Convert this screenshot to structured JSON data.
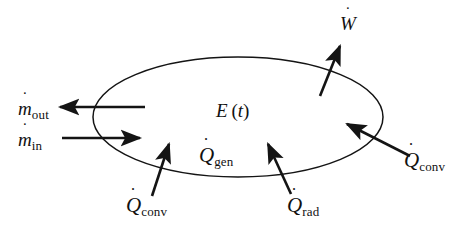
{
  "diagram": {
    "type": "control-volume-energy-balance",
    "stroke_color": "#141414",
    "background_color": "#ffffff",
    "boundary": {
      "shape": "ellipse",
      "name": "control-volume-boundary",
      "center_x": 238,
      "center_y": 117,
      "radius_x": 145,
      "radius_y": 60
    },
    "labels": {
      "energy_symbol": "E",
      "energy_arg_open": "(",
      "energy_arg_var": "t",
      "energy_arg_close": ")",
      "energy_full": "E (t)",
      "mdot_symbol": "m",
      "mdot_out_sub": "out",
      "mdot_in_sub": "in",
      "q_symbol": "Q",
      "w_symbol": "W",
      "q_gen_sub": "gen",
      "q_rad_sub": "rad",
      "q_conv_sub": "conv"
    },
    "flows": [
      {
        "id": "mdot-out",
        "name": "mass-flow-out",
        "symbol": "m",
        "subscript": "out",
        "direction": "out",
        "orientation": "left",
        "label_x": 18,
        "label_y": 99
      },
      {
        "id": "mdot-in",
        "name": "mass-flow-in",
        "symbol": "m",
        "subscript": "in",
        "direction": "in",
        "orientation": "right",
        "label_x": 18,
        "label_y": 130
      },
      {
        "id": "w-dot",
        "name": "work-rate-out",
        "symbol": "W",
        "subscript": "",
        "direction": "out",
        "orientation": "up-right",
        "label_x": 340,
        "label_y": 14
      },
      {
        "id": "q-conv-left",
        "name": "heat-rate-convection-bottom-left",
        "symbol": "Q",
        "subscript": "conv",
        "direction": "in",
        "orientation": "up",
        "label_x": 126,
        "label_y": 195
      },
      {
        "id": "q-rad",
        "name": "heat-rate-radiation-bottom",
        "symbol": "Q",
        "subscript": "rad",
        "direction": "in",
        "orientation": "up-left",
        "label_x": 287,
        "label_y": 195
      },
      {
        "id": "q-conv-right",
        "name": "heat-rate-convection-right",
        "symbol": "Q",
        "subscript": "conv",
        "direction": "in",
        "orientation": "up-left",
        "label_x": 404,
        "label_y": 150
      },
      {
        "id": "q-gen",
        "name": "heat-rate-generation-internal",
        "symbol": "Q",
        "subscript": "gen",
        "direction": "internal",
        "orientation": "none",
        "label_x": 199,
        "label_y": 145
      }
    ]
  }
}
